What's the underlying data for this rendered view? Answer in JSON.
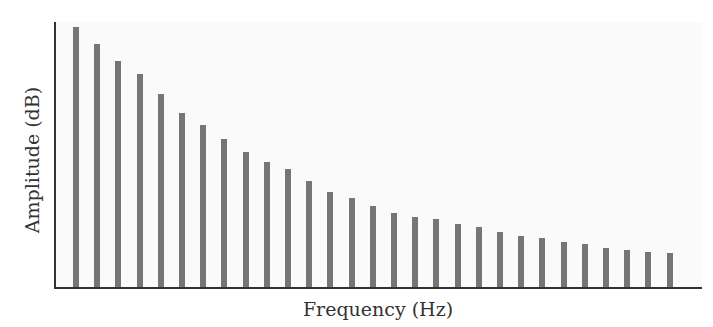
{
  "chart_data": {
    "type": "bar",
    "title": "",
    "xlabel": "Frequency (Hz)",
    "ylabel": "Amplitude (dB)",
    "categories": [
      1,
      2,
      3,
      4,
      5,
      6,
      7,
      8,
      9,
      10,
      11,
      12,
      13,
      14,
      15,
      16,
      17,
      18,
      19,
      20,
      21,
      22,
      23,
      24,
      25,
      26,
      27,
      28,
      29
    ],
    "values": [
      260,
      243,
      226,
      213,
      193,
      174,
      162,
      148,
      135,
      125,
      118,
      106,
      95,
      89,
      81,
      74,
      70,
      68,
      63,
      60,
      55,
      51,
      49,
      45,
      43,
      39,
      37,
      35,
      34
    ],
    "units_note": "relative heights (no axis ticks shown)",
    "ylim": [
      0,
      265
    ],
    "grid": false,
    "legend": null,
    "bar_color": "#767676"
  },
  "axes": {
    "xlabel": "Frequency (Hz)",
    "ylabel": "Amplitude (dB)"
  }
}
